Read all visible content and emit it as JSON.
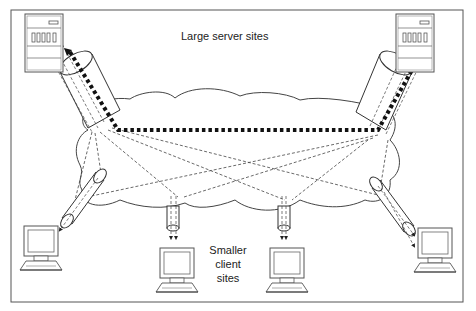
{
  "diagram": {
    "type": "network-topology",
    "labels": {
      "servers": "Large server sites",
      "clients_line1": "Smaller",
      "clients_line2": "client",
      "clients_line3": "sites"
    },
    "nodes": [
      {
        "id": "server-left",
        "kind": "server"
      },
      {
        "id": "server-right",
        "kind": "server"
      },
      {
        "id": "client-1",
        "kind": "client"
      },
      {
        "id": "client-2",
        "kind": "client"
      },
      {
        "id": "client-3",
        "kind": "client"
      },
      {
        "id": "client-4",
        "kind": "client"
      }
    ],
    "links": [
      {
        "from": "server-left",
        "to": "server-right",
        "style": "heavy-dotted"
      },
      {
        "from": "server-left",
        "to": "client-1",
        "style": "dashed"
      },
      {
        "from": "server-left",
        "to": "client-2",
        "style": "dashed"
      },
      {
        "from": "server-left",
        "to": "client-3",
        "style": "dashed"
      },
      {
        "from": "server-left",
        "to": "client-4",
        "style": "dashed"
      },
      {
        "from": "server-right",
        "to": "client-1",
        "style": "dashed"
      },
      {
        "from": "server-right",
        "to": "client-2",
        "style": "dashed"
      },
      {
        "from": "server-right",
        "to": "client-3",
        "style": "dashed"
      },
      {
        "from": "server-right",
        "to": "client-4",
        "style": "dashed"
      }
    ],
    "colors": {
      "line": "#333333",
      "background": "#ffffff"
    }
  }
}
